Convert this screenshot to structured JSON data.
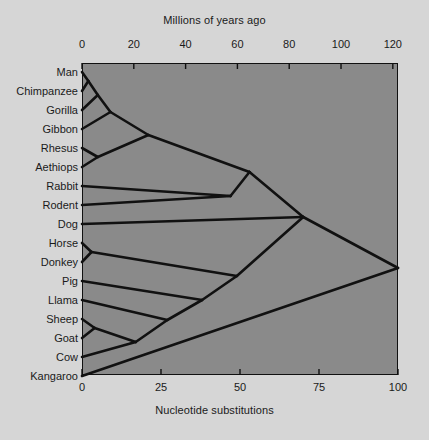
{
  "figure": {
    "top_axis_title": "Millions of years ago",
    "bottom_axis_title": "Nucleotide substitutions",
    "plot_bg_color": "#8a8a8a",
    "page_bg_color": "#d6d6d6",
    "line_color": "#111111",
    "text_color": "#1a1a1a"
  },
  "chart_data": {
    "type": "line",
    "xlabel": "Nucleotide substitutions",
    "xlabel_top": "Millions of years ago",
    "ylabel": "",
    "grid": false,
    "legend": "none",
    "top_axis": {
      "label": "Millions of years ago",
      "ticks": [
        0,
        20,
        40,
        60,
        80,
        100,
        120
      ],
      "tick_labels": [
        "0",
        "20",
        "40",
        "60",
        "80",
        "100",
        "120"
      ],
      "range": [
        0,
        122
      ]
    },
    "bottom_axis": {
      "label": "Nucleotide substitutions",
      "ticks": [
        0,
        25,
        50,
        75,
        100
      ],
      "tick_labels": [
        "0",
        "25",
        "50",
        "75",
        "100"
      ],
      "range": [
        0,
        100
      ]
    },
    "taxa": [
      {
        "name": "Man",
        "y": 72,
        "x_tip": 0
      },
      {
        "name": "Chimpanzee",
        "y": 91,
        "x_tip": 0
      },
      {
        "name": "Gorilla",
        "y": 110,
        "x_tip": 0
      },
      {
        "name": "Gibbon",
        "y": 129,
        "x_tip": 0
      },
      {
        "name": "Rhesus",
        "y": 148,
        "x_tip": 0
      },
      {
        "name": "Aethiops",
        "y": 167,
        "x_tip": 0
      },
      {
        "name": "Rabbit",
        "y": 186,
        "x_tip": 0
      },
      {
        "name": "Rodent",
        "y": 205,
        "x_tip": 0
      },
      {
        "name": "Dog",
        "y": 224,
        "x_tip": 0
      },
      {
        "name": "Horse",
        "y": 243,
        "x_tip": 0
      },
      {
        "name": "Donkey",
        "y": 262,
        "x_tip": 0
      },
      {
        "name": "Pig",
        "y": 281,
        "x_tip": 0
      },
      {
        "name": "Llama",
        "y": 300,
        "x_tip": 0
      },
      {
        "name": "Sheep",
        "y": 319,
        "x_tip": 0
      },
      {
        "name": "Goat",
        "y": 338,
        "x_tip": 0
      },
      {
        "name": "Cow",
        "y": 357,
        "x_tip": 0
      },
      {
        "name": "Kangaroo",
        "y": 376,
        "x_tip": 0
      }
    ],
    "nodes": [
      {
        "id": "man_chimp",
        "x": 2,
        "y": 81
      },
      {
        "id": "hominid",
        "x": 5,
        "y": 95
      },
      {
        "id": "ape",
        "x": 9,
        "y": 112
      },
      {
        "id": "rhesus_aethiops",
        "x": 5,
        "y": 157
      },
      {
        "id": "catarrhine",
        "x": 21,
        "y": 135
      },
      {
        "id": "rabbit_rodent",
        "x": 47,
        "y": 196
      },
      {
        "id": "primate_glires",
        "x": 53,
        "y": 172
      },
      {
        "id": "horse_donkey",
        "x": 3,
        "y": 252
      },
      {
        "id": "sheep_goat",
        "x": 4,
        "y": 328
      },
      {
        "id": "bovid_cow",
        "x": 17,
        "y": 342
      },
      {
        "id": "llama_bovid",
        "x": 27,
        "y": 320
      },
      {
        "id": "pig_artio",
        "x": 38,
        "y": 300
      },
      {
        "id": "perisso_artio",
        "x": 49,
        "y": 276
      },
      {
        "id": "laurasia",
        "x": 70,
        "y": 217
      },
      {
        "id": "placental",
        "x": 100,
        "y": 268
      }
    ],
    "edges": [
      {
        "from_x": 0,
        "from_y": 72,
        "to_x": 2,
        "to_y": 81
      },
      {
        "from_x": 0,
        "from_y": 91,
        "to_x": 2,
        "to_y": 81
      },
      {
        "from_x": 2,
        "from_y": 81,
        "to_x": 5,
        "to_y": 95
      },
      {
        "from_x": 0,
        "from_y": 110,
        "to_x": 5,
        "to_y": 95
      },
      {
        "from_x": 5,
        "from_y": 95,
        "to_x": 9,
        "to_y": 112
      },
      {
        "from_x": 0,
        "from_y": 129,
        "to_x": 9,
        "to_y": 112
      },
      {
        "from_x": 0,
        "from_y": 148,
        "to_x": 5,
        "to_y": 157
      },
      {
        "from_x": 0,
        "from_y": 167,
        "to_x": 5,
        "to_y": 157
      },
      {
        "from_x": 9,
        "from_y": 112,
        "to_x": 21,
        "to_y": 135
      },
      {
        "from_x": 5,
        "from_y": 157,
        "to_x": 21,
        "to_y": 135
      },
      {
        "from_x": 0,
        "from_y": 186,
        "to_x": 47,
        "to_y": 196
      },
      {
        "from_x": 0,
        "from_y": 205,
        "to_x": 47,
        "to_y": 196
      },
      {
        "from_x": 21,
        "from_y": 135,
        "to_x": 53,
        "to_y": 172
      },
      {
        "from_x": 47,
        "from_y": 196,
        "to_x": 53,
        "to_y": 172
      },
      {
        "from_x": 53,
        "from_y": 172,
        "to_x": 70,
        "to_y": 217
      },
      {
        "from_x": 0,
        "from_y": 224,
        "to_x": 70,
        "to_y": 217
      },
      {
        "from_x": 0,
        "from_y": 243,
        "to_x": 3,
        "to_y": 252
      },
      {
        "from_x": 0,
        "from_y": 262,
        "to_x": 3,
        "to_y": 252
      },
      {
        "from_x": 3,
        "from_y": 252,
        "to_x": 49,
        "to_y": 276
      },
      {
        "from_x": 0,
        "from_y": 319,
        "to_x": 4,
        "to_y": 328
      },
      {
        "from_x": 0,
        "from_y": 338,
        "to_x": 4,
        "to_y": 328
      },
      {
        "from_x": 4,
        "from_y": 328,
        "to_x": 17,
        "to_y": 342
      },
      {
        "from_x": 0,
        "from_y": 357,
        "to_x": 17,
        "to_y": 342
      },
      {
        "from_x": 17,
        "from_y": 342,
        "to_x": 27,
        "to_y": 320
      },
      {
        "from_x": 0,
        "from_y": 300,
        "to_x": 27,
        "to_y": 320
      },
      {
        "from_x": 27,
        "from_y": 320,
        "to_x": 38,
        "to_y": 300
      },
      {
        "from_x": 0,
        "from_y": 281,
        "to_x": 38,
        "to_y": 300
      },
      {
        "from_x": 38,
        "from_y": 300,
        "to_x": 49,
        "to_y": 276
      },
      {
        "from_x": 49,
        "from_y": 276,
        "to_x": 70,
        "to_y": 217
      },
      {
        "from_x": 70,
        "from_y": 217,
        "to_x": 100,
        "to_y": 268
      },
      {
        "from_x": 0,
        "from_y": 376,
        "to_x": 100,
        "to_y": 268
      }
    ]
  }
}
